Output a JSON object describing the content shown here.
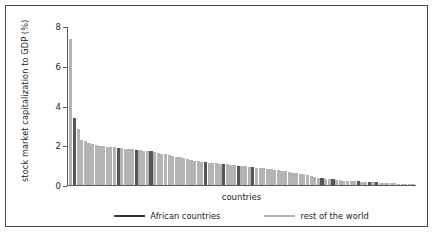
{
  "chart_data": {
    "type": "bar",
    "title": "",
    "xlabel": "countries",
    "ylabel": "stock market capitalization to GDP (%)",
    "ylim": [
      0,
      8
    ],
    "yticks": [
      "0",
      "2",
      "4",
      "6",
      "8"
    ],
    "ytick_values": [
      0,
      2,
      4,
      6,
      8
    ],
    "grid": false,
    "legend_position": "bottom-center",
    "legend": [
      {
        "label": "African countries",
        "color": "#555555"
      },
      {
        "label": "rest of the world",
        "color": "#b3b3b3"
      }
    ],
    "series_note": "single series of country values, sorted descending; each bar colored by group",
    "categories": [
      "c1",
      "c2",
      "c3",
      "c4",
      "c5",
      "c6",
      "c7",
      "c8",
      "c9",
      "c10",
      "c11",
      "c12",
      "c13",
      "c14",
      "c15",
      "c16",
      "c17",
      "c18",
      "c19",
      "c20",
      "c21",
      "c22",
      "c23",
      "c24",
      "c25",
      "c26",
      "c27",
      "c28",
      "c29",
      "c30",
      "c31",
      "c32",
      "c33",
      "c34",
      "c35",
      "c36",
      "c37",
      "c38",
      "c39",
      "c40",
      "c41",
      "c42",
      "c43",
      "c44",
      "c45",
      "c46",
      "c47",
      "c48",
      "c49",
      "c50",
      "c51",
      "c52",
      "c53",
      "c54",
      "c55",
      "c56",
      "c57",
      "c58",
      "c59",
      "c60",
      "c61",
      "c62",
      "c63",
      "c64",
      "c65",
      "c66",
      "c67",
      "c68",
      "c69",
      "c70",
      "c71",
      "c72",
      "c73",
      "c74",
      "c75",
      "c76",
      "c77",
      "c78",
      "c79",
      "c80",
      "c81",
      "c82",
      "c83",
      "c84",
      "c85",
      "c86",
      "c87",
      "c88",
      "c89",
      "c90",
      "c91",
      "c92",
      "c93",
      "c94",
      "c95"
    ],
    "values": [
      7.4,
      3.4,
      2.85,
      2.3,
      2.22,
      2.12,
      2.08,
      2.05,
      2.0,
      1.98,
      1.95,
      1.92,
      1.9,
      1.88,
      1.86,
      1.84,
      1.82,
      1.8,
      1.78,
      1.76,
      1.74,
      1.72,
      1.7,
      1.66,
      1.62,
      1.58,
      1.55,
      1.52,
      1.48,
      1.44,
      1.4,
      1.36,
      1.32,
      1.28,
      1.24,
      1.2,
      1.18,
      1.16,
      1.14,
      1.12,
      1.1,
      1.08,
      1.06,
      1.04,
      1.02,
      1.0,
      0.98,
      0.96,
      0.94,
      0.92,
      0.9,
      0.88,
      0.86,
      0.84,
      0.82,
      0.8,
      0.78,
      0.75,
      0.72,
      0.69,
      0.66,
      0.63,
      0.6,
      0.57,
      0.54,
      0.5,
      0.46,
      0.42,
      0.38,
      0.35,
      0.32,
      0.3,
      0.28,
      0.26,
      0.24,
      0.22,
      0.21,
      0.2,
      0.19,
      0.18,
      0.17,
      0.16,
      0.15,
      0.14,
      0.13,
      0.12,
      0.11,
      0.1,
      0.09,
      0.08,
      0.07,
      0.06,
      0.05,
      0.04,
      0.03
    ],
    "groups": [
      "world",
      "africa",
      "world",
      "world",
      "world",
      "world",
      "world",
      "world",
      "world",
      "world",
      "world",
      "world",
      "world",
      "africa",
      "world",
      "world",
      "world",
      "world",
      "africa",
      "world",
      "world",
      "world",
      "africa",
      "world",
      "world",
      "world",
      "world",
      "world",
      "world",
      "world",
      "world",
      "world",
      "world",
      "world",
      "world",
      "world",
      "world",
      "africa",
      "world",
      "world",
      "world",
      "world",
      "africa",
      "world",
      "world",
      "world",
      "africa",
      "world",
      "world",
      "world",
      "africa",
      "world",
      "world",
      "world",
      "world",
      "world",
      "world",
      "world",
      "world",
      "world",
      "world",
      "world",
      "world",
      "world",
      "world",
      "world",
      "world",
      "world",
      "world",
      "africa",
      "world",
      "world",
      "africa",
      "world",
      "world",
      "world",
      "world",
      "world",
      "world",
      "africa",
      "world",
      "world",
      "africa",
      "world",
      "africa",
      "world",
      "world",
      "world",
      "world",
      "world",
      "world",
      "world",
      "world",
      "world",
      "world"
    ]
  }
}
